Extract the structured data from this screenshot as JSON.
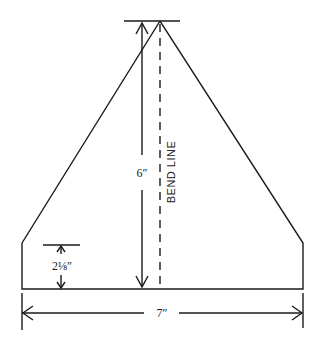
{
  "diagram": {
    "type": "pattern-template",
    "shape": "pentagon (triangle with truncated base corners)",
    "labels": {
      "height": "6″",
      "bend_line": "BEND LINE",
      "side_height": "2⅛″",
      "width": "7″"
    },
    "colors": {
      "line": "#1a1a1a",
      "background": "#ffffff"
    }
  }
}
